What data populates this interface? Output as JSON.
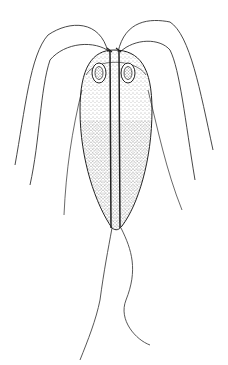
{
  "figure": {
    "colors": {
      "background": "#ffffff",
      "ink": "#222222",
      "stipple": "#555555"
    },
    "parts": [
      "body",
      "median-axostyle-left",
      "median-axostyle-right",
      "nucleus-left",
      "nucleus-right",
      "anterior-flagella",
      "lateral-flagella",
      "caudal-flagella"
    ],
    "caption_fragment": ""
  }
}
